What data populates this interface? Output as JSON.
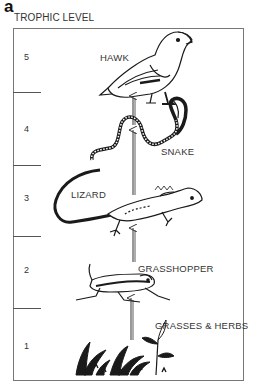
{
  "figure": {
    "panel_letter": "a",
    "axis_title": "TROPHIC LEVEL",
    "levels": [
      {
        "number": "5",
        "organism": "HAWK"
      },
      {
        "number": "4",
        "organism": "SNAKE"
      },
      {
        "number": "3",
        "organism": "LIZARD"
      },
      {
        "number": "2",
        "organism": "GRASSHOPPER"
      },
      {
        "number": "1",
        "organism": "GRASSES & HERBS"
      }
    ],
    "arrows": "upward energy flow arrows between levels",
    "colors": {
      "ink": "#1a1a1a",
      "frame": "#777777",
      "background": "#ffffff"
    }
  }
}
